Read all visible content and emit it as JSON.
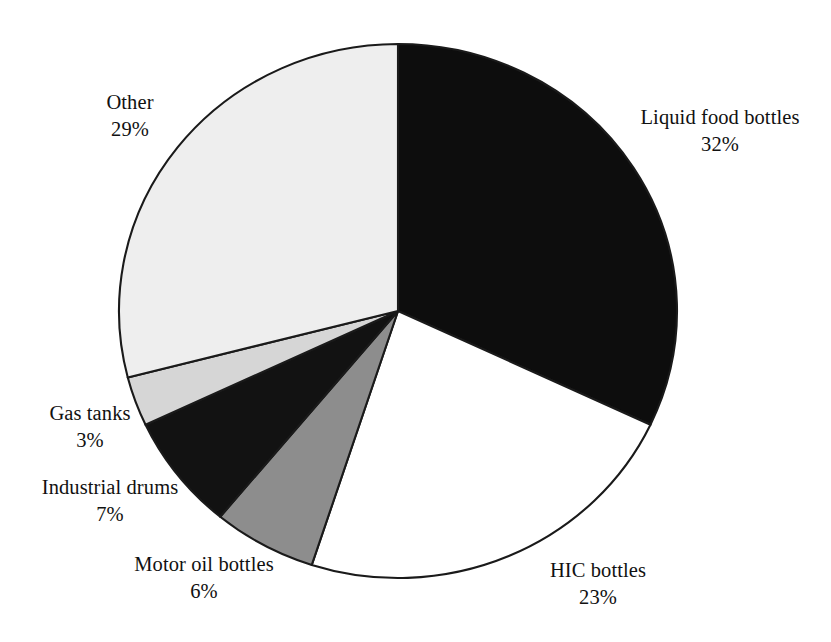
{
  "chart_data": {
    "type": "pie",
    "title": "",
    "subtitle": "",
    "xlabel": "",
    "ylabel": "",
    "legend_position": "none",
    "grid": false,
    "start_angle_deg": 0,
    "direction": "clockwise",
    "categories": [
      "Liquid food bottles",
      "HIC bottles",
      "Motor oil bottles",
      "Industrial drums",
      "Gas tanks",
      "Other"
    ],
    "values": [
      32,
      23,
      6,
      7,
      3,
      29
    ],
    "value_suffix": "%",
    "slices": [
      {
        "label": "Liquid food bottles",
        "value": 32,
        "value_text": "32%",
        "fill": "#0d0d0d",
        "stroke": "#1a1a1a"
      },
      {
        "label": "HIC bottles",
        "value": 23,
        "value_text": "23%",
        "fill": "#ffffff",
        "stroke": "#1a1a1a"
      },
      {
        "label": "Motor oil bottles",
        "value": 6,
        "value_text": "6%",
        "fill": "#8d8d8d",
        "stroke": "#1a1a1a"
      },
      {
        "label": "Industrial drums",
        "value": 7,
        "value_text": "7%",
        "fill": "#121212",
        "stroke": "#1a1a1a"
      },
      {
        "label": "Gas tanks",
        "value": 3,
        "value_text": "3%",
        "fill": "#d6d6d6",
        "stroke": "#1a1a1a"
      },
      {
        "label": "Other",
        "value": 29,
        "value_text": "29%",
        "fill": "#eeeeee",
        "stroke": "#1a1a1a"
      }
    ]
  },
  "labels": {
    "liquid_food_bottles": {
      "name": "Liquid food bottles",
      "value": "32%"
    },
    "hic_bottles": {
      "name": "HIC bottles",
      "value": "23%"
    },
    "motor_oil_bottles": {
      "name": "Motor oil bottles",
      "value": "6%"
    },
    "industrial_drums": {
      "name": "Industrial drums",
      "value": "7%"
    },
    "gas_tanks": {
      "name": "Gas tanks",
      "value": "3%"
    },
    "other": {
      "name": "Other",
      "value": "29%"
    }
  },
  "geometry": {
    "center_x": 398,
    "center_y": 311,
    "radius_x": 279,
    "radius_y": 267
  }
}
